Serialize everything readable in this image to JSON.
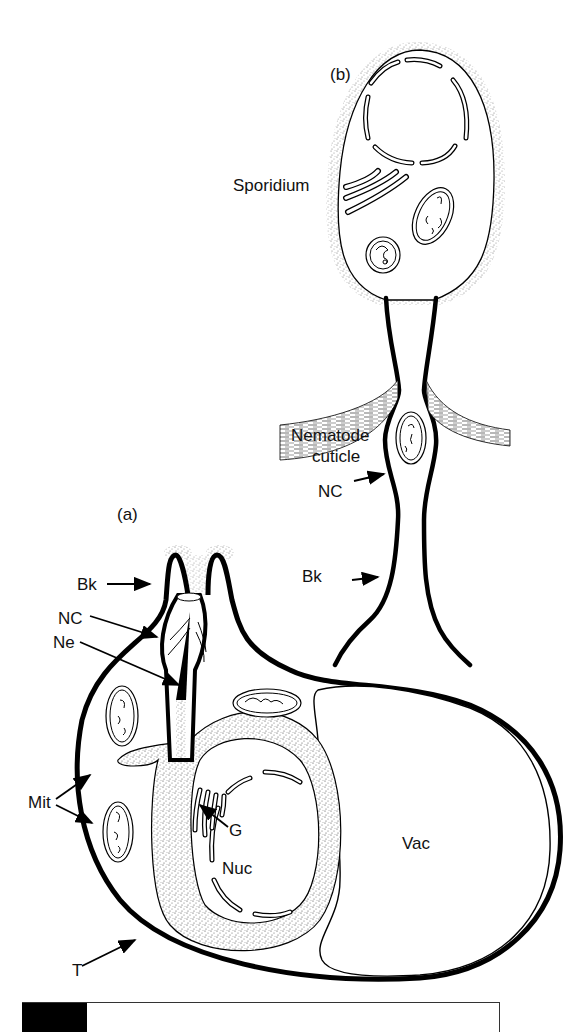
{
  "figure": {
    "panel_a_label": "(a)",
    "panel_b_label": "(b)",
    "labels_b": {
      "sporidium": "Sporidium",
      "cuticle_line1": "Nematode",
      "cuticle_line2": "cuticle",
      "nc": "NC",
      "bk": "Bk"
    },
    "labels_a": {
      "bk": "Bk",
      "nc": "NC",
      "ne": "Ne",
      "mit": "Mit",
      "g": "G",
      "nuc": "Nuc",
      "vac": "Vac",
      "t": "T"
    },
    "colors": {
      "ink": "#000000",
      "background": "#ffffff",
      "stipple": "#9a9a9a"
    }
  }
}
